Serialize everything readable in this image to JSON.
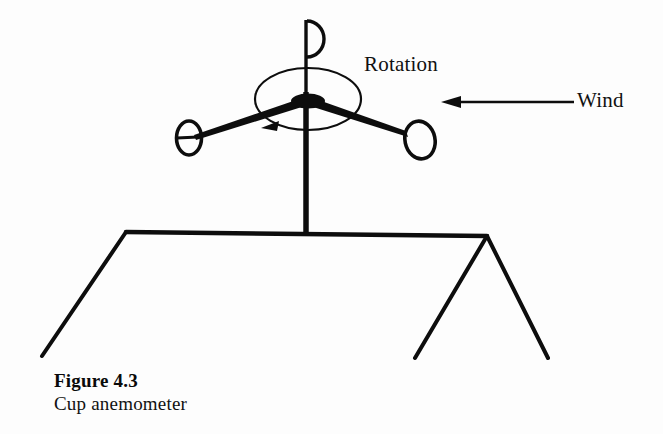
{
  "figure": {
    "caption_title": "Figure 4.3",
    "caption_subtitle": "Cup anemometer",
    "background_color": "#fdfdfd",
    "ink_color": "#000000"
  },
  "labels": {
    "rotation": "Rotation",
    "wind": "Wind"
  },
  "diagram": {
    "type": "line-drawing",
    "parts": [
      {
        "name": "mast",
        "description": "vertical pole from hub down to roof ridge"
      },
      {
        "name": "hub",
        "description": "solid black ellipse at top of mast"
      },
      {
        "name": "top-arm",
        "description": "vertical arm above hub with D-shaped cup"
      },
      {
        "name": "left-arm",
        "description": "arm sloping down-left with open elliptical cup"
      },
      {
        "name": "right-arm",
        "description": "arm sloping down-right with open elliptical cup"
      },
      {
        "name": "rotation-ellipse",
        "description": "thin ellipse around hub showing spin path"
      },
      {
        "name": "rotation-arrow",
        "description": "arrowhead on rotation ellipse pointing left"
      },
      {
        "name": "wind-arrow",
        "description": "horizontal arrow pointing left toward anemometer"
      },
      {
        "name": "roof",
        "description": "house roof with ridge, left slope and right gable"
      }
    ]
  },
  "geometry": {
    "hub": {
      "cx": 308,
      "cy": 101,
      "rx": 17,
      "ry": 7
    },
    "mast": {
      "x": 306,
      "y_top": 96,
      "y_bottom": 234,
      "width": 5
    },
    "top_cup": {
      "stem_x": 306,
      "stem_top": 20,
      "cup_cy": 38,
      "cup_r": 17
    },
    "left_cup": {
      "cx": 190,
      "cy": 138,
      "rx": 13,
      "ry": 17
    },
    "right_cup": {
      "cx": 419,
      "cy": 139,
      "rx": 15,
      "ry": 19
    },
    "rotation_ellipse": {
      "cx": 308,
      "cy": 99,
      "rx": 53,
      "ry": 31
    },
    "rotation_arrow_tip": {
      "x": 262,
      "y": 128
    },
    "wind_arrow": {
      "x_tail": 574,
      "x_tip": 442,
      "y": 102
    },
    "roof": {
      "ridge_left": {
        "x": 126,
        "y": 232
      },
      "ridge_right": {
        "x": 487,
        "y": 236
      },
      "left_eave": {
        "x": 42,
        "y": 356
      },
      "gable_left_foot": {
        "x": 415,
        "y": 358
      },
      "gable_right_foot": {
        "x": 548,
        "y": 358
      }
    }
  }
}
